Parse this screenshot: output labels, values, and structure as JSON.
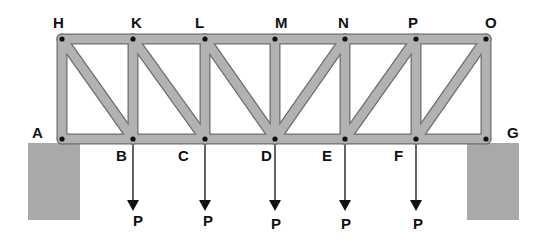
{
  "diagram": {
    "type": "pratt-truss-bridge",
    "colors": {
      "member_fill": "#b2b2b2",
      "member_outline": "#6e6e6e",
      "support": "#a9a9a9",
      "pin": "#111111",
      "label": "#111111"
    },
    "nodes": {
      "top": [
        {
          "id": "H",
          "x": 62,
          "y": 39
        },
        {
          "id": "K",
          "x": 133,
          "y": 39
        },
        {
          "id": "L",
          "x": 205,
          "y": 39
        },
        {
          "id": "M",
          "x": 275,
          "y": 39
        },
        {
          "id": "N",
          "x": 345,
          "y": 39
        },
        {
          "id": "P",
          "x": 416,
          "y": 39
        },
        {
          "id": "O",
          "x": 486,
          "y": 39
        }
      ],
      "bottom": [
        {
          "id": "A",
          "x": 62,
          "y": 139
        },
        {
          "id": "B",
          "x": 133,
          "y": 139
        },
        {
          "id": "C",
          "x": 205,
          "y": 139
        },
        {
          "id": "D",
          "x": 275,
          "y": 139
        },
        {
          "id": "E",
          "x": 345,
          "y": 139
        },
        {
          "id": "F",
          "x": 416,
          "y": 139
        },
        {
          "id": "G",
          "x": 486,
          "y": 139
        }
      ]
    },
    "labels": [
      {
        "text": "H",
        "x": 53,
        "y": 28
      },
      {
        "text": "K",
        "x": 131,
        "y": 28
      },
      {
        "text": "L",
        "x": 195,
        "y": 28
      },
      {
        "text": "M",
        "x": 275,
        "y": 28
      },
      {
        "text": "N",
        "x": 338,
        "y": 28
      },
      {
        "text": "P",
        "x": 408,
        "y": 28
      },
      {
        "text": "O",
        "x": 485,
        "y": 28
      },
      {
        "text": "A",
        "x": 32,
        "y": 138
      },
      {
        "text": "G",
        "x": 507,
        "y": 138
      },
      {
        "text": "B",
        "x": 116,
        "y": 161
      },
      {
        "text": "C",
        "x": 178,
        "y": 161
      },
      {
        "text": "D",
        "x": 261,
        "y": 161
      },
      {
        "text": "E",
        "x": 322,
        "y": 161
      },
      {
        "text": "F",
        "x": 394,
        "y": 161
      }
    ],
    "members": {
      "top_chord": [
        "H-K",
        "K-L",
        "L-M",
        "M-N",
        "N-P",
        "P-O"
      ],
      "bottom_chord": [
        "A-B",
        "B-C",
        "C-D",
        "D-E",
        "E-F",
        "F-G"
      ],
      "verticals": [
        "H-A",
        "K-B",
        "L-C",
        "M-D",
        "N-E",
        "P-F",
        "O-G"
      ],
      "diagonals": [
        "H-B",
        "K-C",
        "L-D",
        "D-N",
        "E-P",
        "F-O"
      ]
    },
    "supports": [
      {
        "name": "left-support",
        "x": 28,
        "y": 143,
        "w": 52,
        "h": 77
      },
      {
        "name": "right-support",
        "x": 467,
        "y": 143,
        "w": 52,
        "h": 77
      }
    ],
    "loads": [
      {
        "node": "B",
        "x": 133,
        "label": "P",
        "label_x": 133,
        "label_y": 226
      },
      {
        "node": "C",
        "x": 205,
        "label": "P",
        "label_x": 203,
        "label_y": 226
      },
      {
        "node": "D",
        "x": 275,
        "label": "P",
        "label_x": 271,
        "label_y": 229
      },
      {
        "node": "E",
        "x": 345,
        "label": "P",
        "label_x": 341,
        "label_y": 229
      },
      {
        "node": "F",
        "x": 416,
        "label": "P",
        "label_x": 413,
        "label_y": 229
      }
    ],
    "load_geometry": {
      "y_start": 145,
      "y_tip": 211,
      "head_height": 11,
      "head_half_width": 6
    }
  }
}
